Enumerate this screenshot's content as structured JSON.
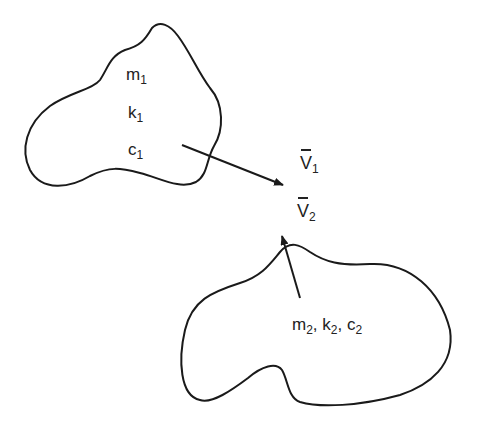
{
  "diagram": {
    "body1": {
      "labels": {
        "mass": {
          "base": "m",
          "sub": "1"
        },
        "stiffness": {
          "base": "k",
          "sub": "1"
        },
        "damping": {
          "base": "c",
          "sub": "1"
        }
      }
    },
    "body2": {
      "label": {
        "m": "m",
        "m_sub": "2",
        "sep1": ", ",
        "k": "k",
        "k_sub": "2",
        "sep2": ", ",
        "c": "c",
        "c_sub": "2"
      }
    },
    "vectors": {
      "v1": {
        "base": "V",
        "sub": "1"
      },
      "v2": {
        "base": "V",
        "sub": "2"
      }
    },
    "colors": {
      "stroke": "#1a1a1a",
      "text": "#222222",
      "background": "#ffffff"
    }
  }
}
